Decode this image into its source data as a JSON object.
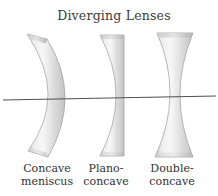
{
  "figure": {
    "title": "Diverging Lenses",
    "lenses": [
      {
        "name": "concave-meniscus",
        "label_line1": "Concave",
        "label_line2": "meniscus"
      },
      {
        "name": "plano-concave",
        "label_line1": "Plano-",
        "label_line2": "concave"
      },
      {
        "name": "double-concave",
        "label_line1": "Double-",
        "label_line2": "concave"
      }
    ],
    "axis": {
      "name": "optical-axis"
    },
    "colors": {
      "background": "#ffffff",
      "title_text": "#3a3a3a",
      "label_text": "#303030",
      "axis_line": "#4f4f4f",
      "lens_edge": "#9a9a9a",
      "lens_body_light": "#f7f7f7",
      "lens_body_mid": "#e0e0e0",
      "lens_body_dark": "#c3c3c3",
      "lens_cap_dark": "#b2b2b2"
    }
  }
}
